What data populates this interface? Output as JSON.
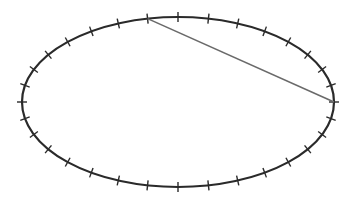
{
  "diagram": {
    "type": "ellipse-with-ticks-and-chord",
    "ellipse": {
      "tick_count": 32,
      "tick_spacing": "uniform parametric angle",
      "stroke_color": "#2a2a2a"
    },
    "chord": {
      "from_tick_index": 9,
      "to_tick_index": 0,
      "description": "segment from upper-left-of-top tick to rightmost point of ellipse",
      "stroke_color": "#6a6a6a"
    },
    "colors": {
      "background": "#ffffff",
      "tick": "#2a2a2a"
    }
  }
}
